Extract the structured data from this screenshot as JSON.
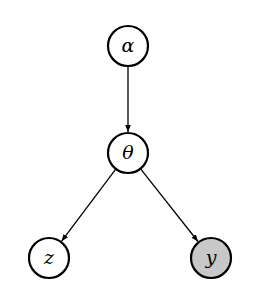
{
  "diagram": {
    "type": "bayesian-network",
    "nodes": [
      {
        "id": "alpha",
        "label": "α",
        "cx": 128,
        "cy": 46,
        "r": 20,
        "fill": "#ffffff",
        "observed": false
      },
      {
        "id": "theta",
        "label": "θ",
        "cx": 128,
        "cy": 153,
        "r": 20,
        "fill": "#ffffff",
        "observed": false
      },
      {
        "id": "z",
        "label": "z",
        "cx": 49,
        "cy": 258,
        "r": 20,
        "fill": "#ffffff",
        "observed": false
      },
      {
        "id": "y",
        "label": "y",
        "cx": 211,
        "cy": 258,
        "r": 20,
        "fill": "#c8c8c8",
        "observed": true
      }
    ],
    "edges": [
      {
        "from": "alpha",
        "to": "theta"
      },
      {
        "from": "theta",
        "to": "z"
      },
      {
        "from": "theta",
        "to": "y"
      }
    ],
    "stroke_color": "#000000"
  }
}
